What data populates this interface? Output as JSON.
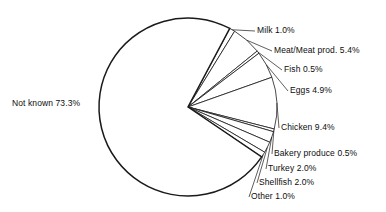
{
  "chart_data": {
    "type": "pie",
    "title": "",
    "subtitle": "",
    "xlabel": "",
    "ylabel": "",
    "legend_position": "none",
    "grid": false,
    "units": "percent",
    "total": 100.0,
    "categories": [
      "Milk",
      "Meat/Meat prod.",
      "Fish",
      "Eggs",
      "Chicken",
      "Bakery produce",
      "Turkey",
      "Shellfish",
      "Other",
      "Not known"
    ],
    "values": [
      1.0,
      5.4,
      0.5,
      4.9,
      9.4,
      0.5,
      2.0,
      2.0,
      1.0,
      73.3
    ],
    "slices": [
      {
        "name": "Milk",
        "value": 1.0,
        "label": "Milk  1.0%"
      },
      {
        "name": "Meat/Meat prod.",
        "value": 5.4,
        "label": "Meat/Meat prod. 5.4%"
      },
      {
        "name": "Fish",
        "value": 0.5,
        "label": "Fish  0.5%"
      },
      {
        "name": "Eggs",
        "value": 4.9,
        "label": "Eggs  4.9%"
      },
      {
        "name": "Chicken",
        "value": 9.4,
        "label": "Chicken  9.4%"
      },
      {
        "name": "Bakery produce",
        "value": 0.5,
        "label": "Bakery produce  0.5%"
      },
      {
        "name": "Turkey",
        "value": 2.0,
        "label": "Turkey  2.0%"
      },
      {
        "name": "Shellfish",
        "value": 2.0,
        "label": "Shellfish  2.0%"
      },
      {
        "name": "Other",
        "value": 1.0,
        "label": "Other  1.0%"
      },
      {
        "name": "Not known",
        "value": 73.3,
        "label": "Not known  73.3%"
      }
    ],
    "colors": {
      "slice_fill": "#ffffff",
      "slice_stroke": "#1a1a1a",
      "text": "#0d0d0d",
      "background": "#ffffff"
    },
    "geometry": {
      "center_x": 188,
      "center_y": 107,
      "radius": 89,
      "start_angle_deg": -62
    }
  },
  "labels": {
    "milk": "Milk  1.0%",
    "meat": "Meat/Meat prod. 5.4%",
    "fish": "Fish  0.5%",
    "eggs": "Eggs  4.9%",
    "chicken": "Chicken  9.4%",
    "bakery": "Bakery produce  0.5%",
    "turkey": "Turkey  2.0%",
    "shellfish": "Shellfish  2.0%",
    "other": "Other  1.0%",
    "not_known": "Not known  73.3%"
  }
}
